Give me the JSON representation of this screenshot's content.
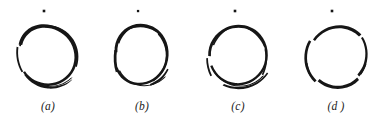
{
  "figure": {
    "background_color": "#ffffff",
    "ink_color": "#161616",
    "width": 385,
    "height": 121
  },
  "panels": [
    {
      "id": "panel-a",
      "label": "(a)",
      "letter": "a",
      "left": 0,
      "dot": {
        "cx": 44,
        "cy": 11,
        "size": 2.6,
        "shape": "square-dot"
      },
      "circle": {
        "cx": 48,
        "cy": 59,
        "rx": 31,
        "ry": 35
      },
      "stroke_style": "overlapping-sweep",
      "notes": "Stroke wraps past 360 degrees with a secondary overlapping arc at the upper-right and lower-left; heaviest ink on the right and bottom-right."
    },
    {
      "id": "panel-b",
      "label": "(b)",
      "letter": "b",
      "left": 94,
      "dot": {
        "cx": 138,
        "cy": 11,
        "size": 2.3,
        "shape": "square-dot"
      },
      "circle": {
        "cx": 142,
        "cy": 59,
        "rx": 28.5,
        "ry": 35
      },
      "stroke_style": "narrow-oval-overlap",
      "notes": "Slightly narrower oval; thick left flank and heavy bottom with a trailing overlap arc at the lower right."
    },
    {
      "id": "panel-c",
      "label": "(c)",
      "letter": "c",
      "left": 190,
      "dot": {
        "cx": 235,
        "cy": 11,
        "size": 2.6,
        "shape": "square-dot"
      },
      "circle": {
        "cx": 239,
        "cy": 59,
        "rx": 31,
        "ry": 34
      },
      "stroke_style": "rounder-overlap",
      "notes": "Rounder ring, even weight with thin openings at the upper-left and a doubled trailing arc along the bottom."
    },
    {
      "id": "panel-d",
      "label": "(d )",
      "letter": "d",
      "left": 288,
      "dot": {
        "cx": 332,
        "cy": 11,
        "size": 2.6,
        "shape": "square-dot"
      },
      "circle": {
        "cx": 336,
        "cy": 59,
        "rx": 30,
        "ry": 35
      },
      "stroke_style": "four-segment-gapped",
      "notes": "Cleanest ring built from four separate strokes with visible white gaps near the NE, NW, SE and SW diagonals."
    }
  ]
}
